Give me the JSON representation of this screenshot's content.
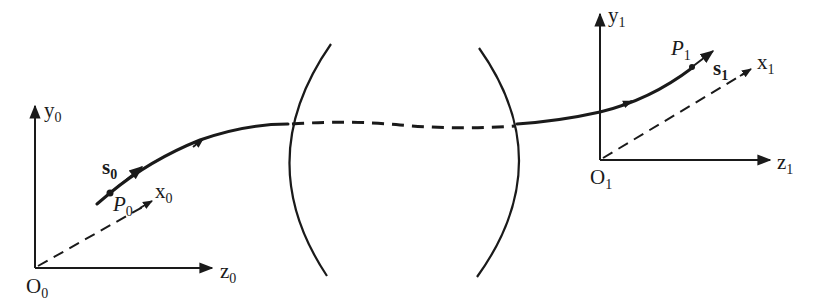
{
  "diagram": {
    "object_frame": {
      "origin": "O",
      "origin_sub": "0",
      "y_axis": "y",
      "y_sub": "0",
      "z_axis": "z",
      "z_sub": "0",
      "x_axis": "x",
      "x_sub": "0",
      "point": "P",
      "point_sub": "0",
      "direction_vector": "s",
      "direction_sub": "0"
    },
    "image_frame": {
      "origin": "O",
      "origin_sub": "1",
      "y_axis": "y",
      "y_sub": "1",
      "z_axis": "z",
      "z_sub": "1",
      "x_axis": "x",
      "x_sub": "1",
      "point": "P",
      "point_sub": "1",
      "direction_vector": "s",
      "direction_sub": "1"
    },
    "optical_system": {
      "elements": [
        "left-lens-surface",
        "right-lens-surface"
      ],
      "ray_inside": "dashed"
    },
    "colors": {
      "ink": "#1a1a1a",
      "background": "#ffffff"
    }
  }
}
